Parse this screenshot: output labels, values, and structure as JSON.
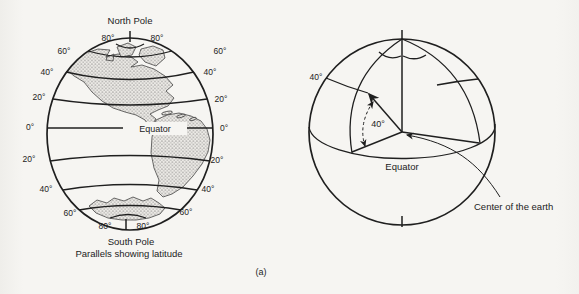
{
  "colors": {
    "background": "#f5f4f1",
    "ink": "#1f1f1f",
    "land_stipple": "#4a4a4a"
  },
  "subfigure_label": "(a)",
  "left_globe": {
    "north_pole_label": "North Pole",
    "south_pole_label": "South Pole",
    "caption": "Parallels showing latitude",
    "equator_label": "Equator",
    "latitude_labels": [
      {
        "lat": "80N",
        "side": "left",
        "text": "80°"
      },
      {
        "lat": "80N",
        "side": "right",
        "text": "80°"
      },
      {
        "lat": "60N",
        "side": "left",
        "text": "60°"
      },
      {
        "lat": "60N",
        "side": "right",
        "text": "60°"
      },
      {
        "lat": "40N",
        "side": "left",
        "text": "40°"
      },
      {
        "lat": "40N",
        "side": "right",
        "text": "40°"
      },
      {
        "lat": "20N",
        "side": "left",
        "text": "20°"
      },
      {
        "lat": "20N",
        "side": "right",
        "text": "20°"
      },
      {
        "lat": "0",
        "side": "left",
        "text": "0°"
      },
      {
        "lat": "0",
        "side": "right",
        "text": "0°"
      },
      {
        "lat": "20S",
        "side": "left",
        "text": "20°"
      },
      {
        "lat": "20S",
        "side": "right",
        "text": "20°"
      },
      {
        "lat": "40S",
        "side": "left",
        "text": "40°"
      },
      {
        "lat": "40S",
        "side": "right",
        "text": "40°"
      },
      {
        "lat": "60S",
        "side": "left",
        "text": "60°"
      },
      {
        "lat": "60S",
        "side": "right",
        "text": "60°"
      },
      {
        "lat": "80S",
        "side": "left",
        "text": "80°"
      },
      {
        "lat": "80S",
        "side": "right",
        "text": "80°"
      }
    ]
  },
  "right_globe": {
    "latitude_label": "40°",
    "angle_label": "40°",
    "equator_label": "Equator",
    "center_of_earth_label": "Center of the earth"
  }
}
